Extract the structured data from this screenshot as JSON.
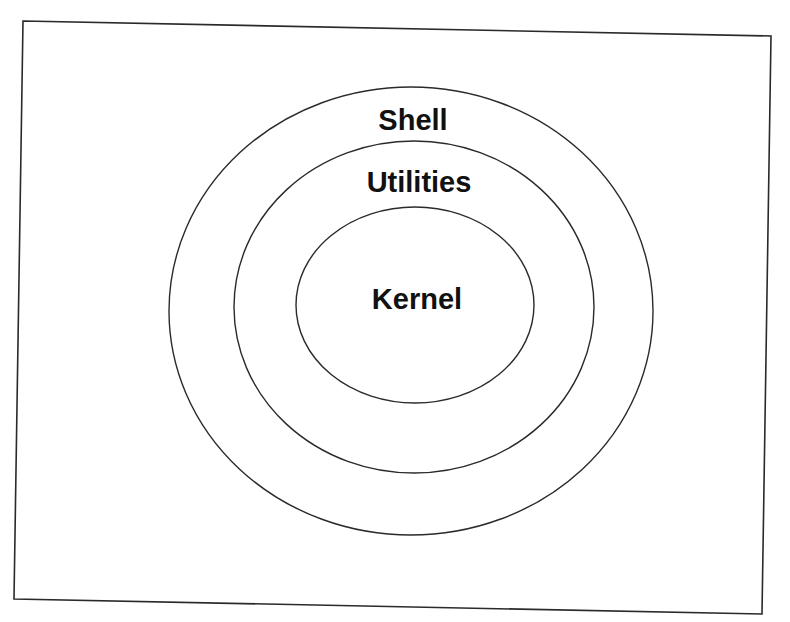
{
  "diagram": {
    "type": "concentric-layers",
    "colors": {
      "background": "#ffffff",
      "stroke": "#2a2a2a",
      "text": "#111111"
    },
    "frame": {
      "points": "23,21 771,36 762,614 14,599"
    },
    "layers": [
      {
        "label": "Shell",
        "cx": 411,
        "cy": 311,
        "rx": 242,
        "ry": 224,
        "label_x": 413,
        "label_y": 130
      },
      {
        "label": "Utilities",
        "cx": 414,
        "cy": 307,
        "rx": 180,
        "ry": 166,
        "label_x": 419,
        "label_y": 192
      },
      {
        "label": "Kernel",
        "cx": 415,
        "cy": 305,
        "rx": 119,
        "ry": 98,
        "label_x": 417,
        "label_y": 309
      }
    ]
  }
}
